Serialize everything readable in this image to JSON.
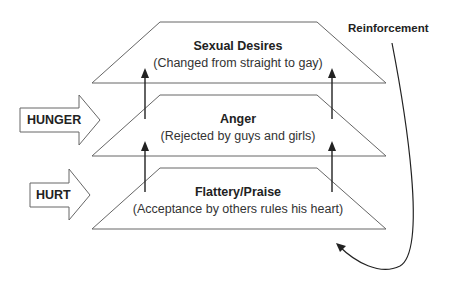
{
  "diagram": {
    "levels": [
      {
        "title": "Sexual Desires",
        "subtitle": "(Changed from straight to gay)"
      },
      {
        "title": "Anger",
        "subtitle": "(Rejected by guys and girls)"
      },
      {
        "title": "Flattery/Praise",
        "subtitle": "(Acceptance by others rules his heart)"
      }
    ],
    "inputs": [
      {
        "label": "HUNGER",
        "target_level": "Anger"
      },
      {
        "label": "HURT",
        "target_level": "Flattery/Praise"
      }
    ],
    "feedback_label": "Reinforcement",
    "colors": {
      "line": "#555555",
      "text": "#222222",
      "background": "#ffffff"
    }
  }
}
